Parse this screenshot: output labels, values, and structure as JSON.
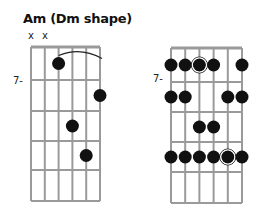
{
  "title": "Am (Dm shape)",
  "left_diagram": {
    "muted_strings": [
      "x",
      "x"
    ],
    "fret_label": "7-",
    "dots": [
      {
        "string": 3,
        "fret": 1
      },
      {
        "string": 6,
        "fret": 2
      },
      {
        "string": 4,
        "fret": 3
      },
      {
        "string": 5,
        "fret": 4
      }
    ],
    "barre": {
      "from_string": 3,
      "to_string": 6,
      "fret": 1
    }
  },
  "right_diagram": {
    "fret_label": "7-",
    "dots": [
      {
        "string": 1,
        "fret": 1
      },
      {
        "string": 2,
        "fret": 1
      },
      {
        "string": 3,
        "fret": 1,
        "root": true
      },
      {
        "string": 4,
        "fret": 1
      },
      {
        "string": 6,
        "fret": 1
      },
      {
        "string": 1,
        "fret": 2
      },
      {
        "string": 2,
        "fret": 2
      },
      {
        "string": 5,
        "fret": 2
      },
      {
        "string": 6,
        "fret": 2
      },
      {
        "string": 3,
        "fret": 3
      },
      {
        "string": 4,
        "fret": 3
      },
      {
        "string": 1,
        "fret": 4
      },
      {
        "string": 2,
        "fret": 4
      },
      {
        "string": 3,
        "fret": 4
      },
      {
        "string": 4,
        "fret": 4
      },
      {
        "string": 5,
        "fret": 4,
        "root": true
      },
      {
        "string": 6,
        "fret": 4
      }
    ]
  },
  "colors": {
    "dot": "#111111",
    "grid": "#9a9a9a"
  }
}
